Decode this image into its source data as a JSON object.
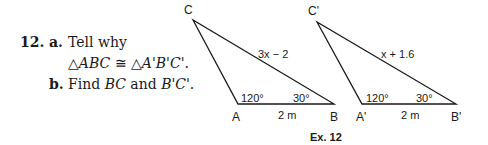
{
  "problem": {
    "number": "12.",
    "part_a": {
      "label": "a.",
      "text_line1": "Tell why",
      "text_line2_prefix": "△",
      "text_line2_t1": "ABC",
      "text_line2_cong": " ≅ △",
      "text_line2_t2": "A'B'C'",
      "text_line2_end": "."
    },
    "part_b": {
      "label": "b.",
      "text_prefix": "Find ",
      "seg1": "BC",
      "text_mid": " and ",
      "seg2": "B'C'",
      "text_end": "."
    }
  },
  "figure": {
    "triangle1": {
      "vertices": {
        "A": "A",
        "B": "B",
        "C": "C"
      },
      "side_BC_label": "3x − 2",
      "side_AB_label": "2 m",
      "angle_A": "120°",
      "angle_B": "30°"
    },
    "triangle2": {
      "vertices": {
        "A": "A'",
        "B": "B'",
        "C": "C'"
      },
      "side_BC_label": "x + 1.6",
      "side_AB_label": "2 m",
      "angle_A": "120°",
      "angle_B": "30°"
    },
    "caption": "Ex. 12"
  }
}
